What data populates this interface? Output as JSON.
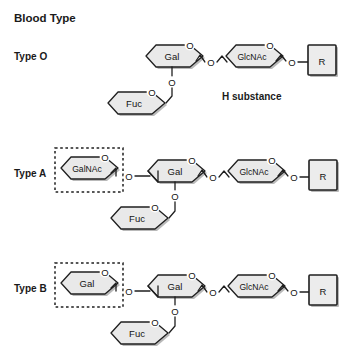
{
  "figure": {
    "title": "Blood Type",
    "note": "H substance",
    "rows": [
      {
        "label": "Type O"
      },
      {
        "label": "Type A"
      },
      {
        "label": "Type B"
      }
    ],
    "residues": {
      "gal": "Gal",
      "galnac": "GalNAc",
      "glcnac": "GlcNAc",
      "fuc": "Fuc",
      "r": "R",
      "oxygen": "O"
    },
    "structures": [
      {
        "name": "Type O",
        "terminal_residue": null,
        "highlighted": false,
        "chain": [
          "Fuc",
          "Gal",
          "GlcNAc",
          "R"
        ],
        "annotation": "H substance"
      },
      {
        "name": "Type A",
        "terminal_residue": "GalNAc",
        "highlighted": true,
        "chain": [
          "GalNAc",
          "Gal",
          "GlcNAc",
          "R"
        ],
        "branch": "Fuc",
        "annotation": null
      },
      {
        "name": "Type B",
        "terminal_residue": "Gal",
        "highlighted": true,
        "chain": [
          "Gal",
          "Gal",
          "GlcNAc",
          "R"
        ],
        "branch": "Fuc",
        "annotation": null
      }
    ],
    "colors": {
      "ring_fill": "#e9e9e9",
      "ring_stroke": "#1f1f1f",
      "box_fill": "#ececec",
      "text": "#1a1a1a",
      "background": "#ffffff"
    }
  }
}
